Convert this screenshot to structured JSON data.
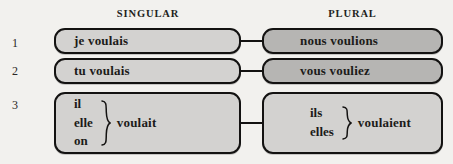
{
  "headers": {
    "singular": "SINGULAR",
    "plural": "PLURAL"
  },
  "row_numbers": [
    "1",
    "2",
    "3"
  ],
  "colors": {
    "page_background": "#f2f1ee",
    "box_light": "#d3d2d0",
    "box_dark": "#b6b5b3",
    "border": "#131211",
    "text": "#1c1b19"
  },
  "rows": [
    {
      "number": "1",
      "singular": {
        "type": "simple",
        "text": "je voulais",
        "shade": "light"
      },
      "plural": {
        "type": "simple",
        "text": "nous voulions",
        "shade": "dark"
      }
    },
    {
      "number": "2",
      "singular": {
        "type": "simple",
        "text": "tu voulais",
        "shade": "light"
      },
      "plural": {
        "type": "simple",
        "text": "vous vouliez",
        "shade": "dark"
      }
    },
    {
      "number": "3",
      "singular": {
        "type": "grouped",
        "pronouns": [
          "il",
          "elle",
          "on"
        ],
        "verb": "voulait",
        "shade": "light"
      },
      "plural": {
        "type": "grouped",
        "pronouns": [
          "ils",
          "elles"
        ],
        "verb": "voulaient",
        "shade": "light"
      }
    }
  ]
}
